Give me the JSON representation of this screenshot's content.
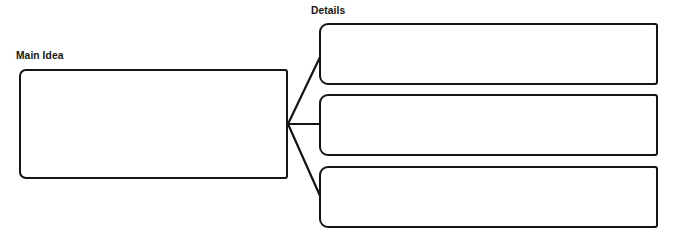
{
  "page": {
    "background_color": "#ffffff",
    "ink_color": "#141414",
    "width": 674,
    "height": 237
  },
  "labels": {
    "main_idea": "Main Idea",
    "details": "Details"
  },
  "main_idea_box": {
    "name": "main-idea-box",
    "value": "",
    "placeholder": ""
  },
  "detail_boxes": [
    {
      "index": 1,
      "value": "",
      "placeholder": ""
    },
    {
      "index": 2,
      "value": "",
      "placeholder": ""
    },
    {
      "index": 3,
      "value": "",
      "placeholder": ""
    }
  ],
  "connectors": {
    "description": "Three lines fan out from the right edge of the main idea box to the left edge of each details box",
    "hub": {
      "x": 292,
      "y": 124
    },
    "lines": [
      {
        "name": "connector-to-detail-1",
        "from": [
          288,
          124
        ],
        "to": [
          320,
          55
        ]
      },
      {
        "name": "connector-to-detail-2",
        "from": [
          288,
          124
        ],
        "to": [
          320,
          124
        ]
      },
      {
        "name": "connector-to-detail-3",
        "from": [
          288,
          124
        ],
        "to": [
          320,
          198
        ]
      }
    ]
  }
}
